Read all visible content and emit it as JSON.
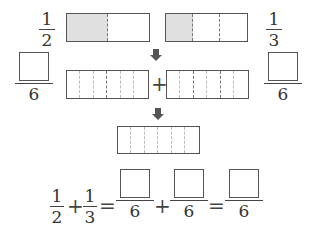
{
  "top": {
    "left_fraction": {
      "numerator": "1",
      "denominator": "2"
    },
    "right_fraction": {
      "numerator": "1",
      "denominator": "3"
    },
    "left_bar": {
      "parts": 2,
      "shaded": 1
    },
    "right_bar": {
      "parts": 3,
      "shaded": 1
    }
  },
  "middle": {
    "left_fraction": {
      "numerator": "",
      "denominator": "6"
    },
    "right_fraction": {
      "numerator": "",
      "denominator": "6"
    },
    "plus": "+",
    "left_bar": {
      "parts": 6
    },
    "right_bar": {
      "parts": 6
    }
  },
  "bottom_bar": {
    "parts": 6
  },
  "equation": {
    "f1": {
      "numerator": "1",
      "denominator": "2"
    },
    "plus1": "+",
    "f2": {
      "numerator": "1",
      "denominator": "3"
    },
    "eq1": "=",
    "f3": {
      "numerator": "",
      "denominator": "6"
    },
    "plus2": "+",
    "f4": {
      "numerator": "",
      "denominator": "6"
    },
    "eq2": "=",
    "f5": {
      "numerator": "",
      "denominator": "6"
    }
  },
  "colors": {
    "shaded": "#e0e0e0",
    "stroke": "#555555"
  }
}
